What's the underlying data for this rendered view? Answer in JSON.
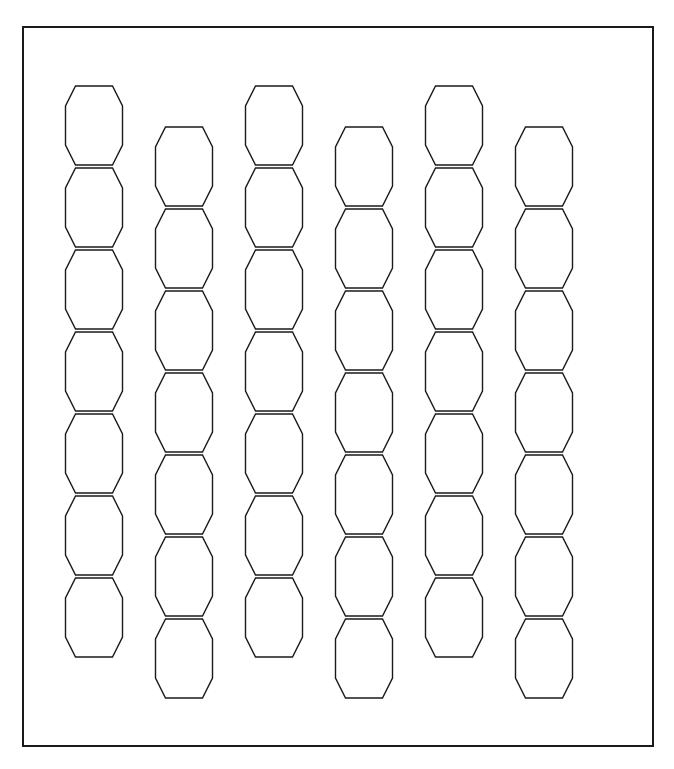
{
  "page": {
    "background_color": "#ffffff",
    "width": 674,
    "height": 769
  },
  "frame": {
    "name": "outer-border-rectangle",
    "x": 23,
    "y": 27,
    "width": 630,
    "height": 719,
    "stroke_color": "#1a1a1a",
    "stroke_width": 2,
    "fill": "none"
  },
  "chart_data": {
    "type": "diagram",
    "subtitle": "",
    "xlabel": "",
    "ylabel": "",
    "grid": true,
    "legend": null,
    "annotations": [],
    "tiling": {
      "shape": "hexagon",
      "orientation": "flat-top-vertical-sides",
      "columns": 6,
      "rows_per_column": 7,
      "total_cells": 42,
      "column_pitch_px": 90,
      "row_pitch_px": 82,
      "odd_column_y_offset_px": 41,
      "origin_x_px": 66,
      "origin_y_px": 86,
      "cell_outer_width_px": 57,
      "cell_flat_top_width_px": 37,
      "cell_height_px": 79,
      "cell_shoulder_px": 20,
      "cell_straight_side_px": 37,
      "stroke_color": "#1a1a1a",
      "stroke_width": 1.4,
      "fill": "none"
    },
    "columns": [
      {
        "index": 0,
        "x_center": 94,
        "y_first_top": 86,
        "cells": 7
      },
      {
        "index": 1,
        "x_center": 184,
        "y_first_top": 127,
        "cells": 7
      },
      {
        "index": 2,
        "x_center": 274,
        "y_first_top": 86,
        "cells": 7
      },
      {
        "index": 3,
        "x_center": 364,
        "y_first_top": 127,
        "cells": 7
      },
      {
        "index": 4,
        "x_center": 454,
        "y_first_top": 86,
        "cells": 7
      },
      {
        "index": 5,
        "x_center": 544,
        "y_first_top": 127,
        "cells": 7
      }
    ]
  },
  "colors": {
    "ink": "#1a1a1a",
    "paper": "#ffffff"
  }
}
